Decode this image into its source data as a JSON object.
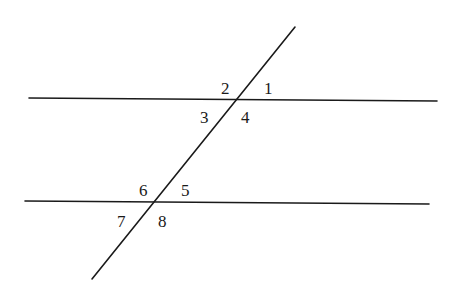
{
  "diagram": {
    "colors": {
      "line": "#1a1a1a",
      "background": "#ffffff"
    },
    "lines": [
      {
        "id": "parallel-line-top",
        "x1": 29,
        "y1": 98,
        "x2": 437,
        "y2": 101
      },
      {
        "id": "parallel-line-bottom",
        "x1": 25,
        "y1": 201,
        "x2": 429,
        "y2": 204
      },
      {
        "id": "transversal",
        "x1": 295,
        "y1": 27,
        "x2": 92,
        "y2": 279
      }
    ],
    "angles": [
      {
        "label": "1",
        "x": 264,
        "y": 94
      },
      {
        "label": "2",
        "x": 221,
        "y": 94
      },
      {
        "label": "3",
        "x": 200,
        "y": 123
      },
      {
        "label": "4",
        "x": 241,
        "y": 123
      },
      {
        "label": "5",
        "x": 181,
        "y": 196
      },
      {
        "label": "6",
        "x": 139,
        "y": 196
      },
      {
        "label": "7",
        "x": 117,
        "y": 227
      },
      {
        "label": "8",
        "x": 158,
        "y": 227
      }
    ]
  }
}
